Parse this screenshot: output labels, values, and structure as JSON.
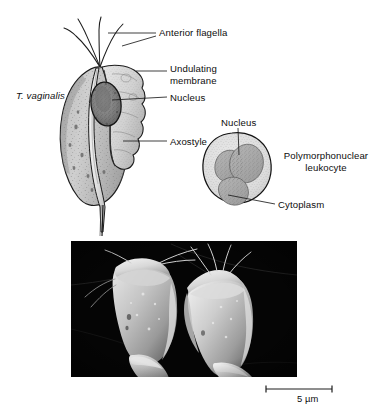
{
  "figure": {
    "domain": "Diagram"
  },
  "diagram": {
    "organism_label": "T. vaginalis",
    "labels": {
      "anterior_flagella": "Anterior flagella",
      "undulating_membrane": "Undulating membrane",
      "nucleus": "Nucleus",
      "axostyle": "Axostyle"
    }
  },
  "leukocyte": {
    "labels": {
      "nucleus": "Nucleus",
      "cell_name": "Polymorphonuclear leukocyte",
      "cytoplasm": "Cytoplasm"
    }
  },
  "micrograph": {
    "scale_bar_label": "5 µm",
    "background_color": "#000000",
    "cell_fill_color": "#c9c9c9",
    "caption": ""
  },
  "colors": {
    "page_background": "#ffffff",
    "ink": "#0d0d0d",
    "leader_line": "#1a1a1a",
    "cell_body_light": "#cfcfcf",
    "cell_body_mid": "#b2b2b2",
    "cell_body_dark": "#8d8d8d",
    "nucleus_dark": "#6d6d6d",
    "leukocyte_fill": "#dedede",
    "leukocyte_nucleus": "#a9a9a9"
  }
}
